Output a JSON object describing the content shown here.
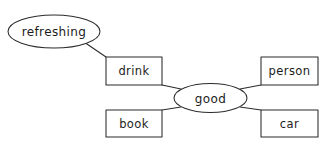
{
  "diagram": {
    "type": "word-web",
    "background_color": "#ffffff",
    "stroke_color": "#2b2b2b",
    "text_color": "#1c1c1c",
    "center_node": {
      "id": "good",
      "label": "good",
      "shape": "ellipse",
      "cx": 210.5,
      "cy": 98,
      "rx": 36.5,
      "ry": 14.5
    },
    "nodes": [
      {
        "id": "refreshing",
        "label": "refreshing",
        "shape": "ellipse",
        "cx": 54,
        "cy": 31.5,
        "rx": 46,
        "ry": 16.5
      },
      {
        "id": "drink",
        "label": "drink",
        "shape": "rect",
        "x": 106,
        "y": 57,
        "width": 56,
        "height": 28
      },
      {
        "id": "book",
        "label": "book",
        "shape": "rect",
        "x": 106,
        "y": 110,
        "width": 56,
        "height": 27
      },
      {
        "id": "person",
        "label": "person",
        "shape": "rect",
        "x": 261,
        "y": 57,
        "width": 57,
        "height": 28
      },
      {
        "id": "car",
        "label": "car",
        "shape": "rect",
        "x": 261,
        "y": 110,
        "width": 57,
        "height": 27
      }
    ],
    "edges": [
      {
        "id": "edge-good-drink",
        "from": "good",
        "to": "drink",
        "x1": 180,
        "y1": 88,
        "x2": 162,
        "y2": 85
      },
      {
        "id": "edge-good-book",
        "from": "good",
        "to": "book",
        "x1": 180,
        "y1": 108,
        "x2": 162,
        "y2": 110
      },
      {
        "id": "edge-good-person",
        "from": "good",
        "to": "person",
        "x1": 241,
        "y1": 88,
        "x2": 261,
        "y2": 85
      },
      {
        "id": "edge-good-car",
        "from": "good",
        "to": "car",
        "x1": 241,
        "y1": 108,
        "x2": 261,
        "y2": 110
      },
      {
        "id": "edge-drink-refreshing",
        "from": "drink",
        "to": "refreshing",
        "x1": 106,
        "y1": 57,
        "x2": 84,
        "y2": 42
      }
    ]
  }
}
